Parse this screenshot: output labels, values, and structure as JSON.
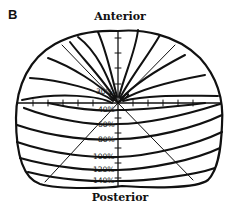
{
  "figure": {
    "panel_label": "B",
    "top_label": "Anterior",
    "bottom_label": "Posterior",
    "contour_labels": [
      "30%",
      "40%",
      "60%",
      "80%",
      "100%",
      "120%",
      "140%"
    ],
    "colors": {
      "line": "#111111",
      "background": "#ffffff"
    }
  }
}
